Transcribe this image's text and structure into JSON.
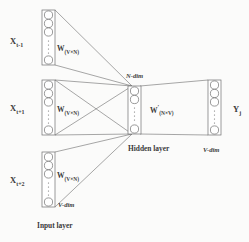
{
  "diagram": {
    "type": "neural-network",
    "stroke_color": "#6f6f6f",
    "text_color": "#3b3b3b",
    "background": "#fbfbfa"
  },
  "input_layer": {
    "caption": "Input layer",
    "dim_label": "V-dim",
    "blocks": [
      {
        "id": "input-block-top",
        "variable": "X",
        "subscript": "t-1",
        "weight": "W",
        "weight_subscript": "(V×N)",
        "neurons": 4,
        "has_vertical_dots": true,
        "x": 42,
        "y": 10,
        "w": 13,
        "h": 55
      },
      {
        "id": "input-block-middle",
        "variable": "X",
        "subscript": "t+1",
        "weight": "W",
        "weight_subscript": "(V×N)",
        "neurons": 4,
        "has_vertical_dots": true,
        "x": 42,
        "y": 80,
        "w": 13,
        "h": 55
      },
      {
        "id": "input-block-bottom",
        "variable": "X",
        "subscript": "t+2",
        "weight": "W",
        "weight_subscript": "(V×N)",
        "neurons": 4,
        "has_vertical_dots": true,
        "x": 42,
        "y": 152,
        "w": 13,
        "h": 55
      }
    ]
  },
  "hidden_layer": {
    "caption": "Hidden layer",
    "dim_label": "N-dim",
    "weight": "W",
    "weight_prime": "′",
    "weight_subscript": "(N×V)",
    "neurons": 4,
    "has_vertical_dots": true,
    "x": 128,
    "y": 86,
    "w": 13,
    "h": 48
  },
  "output_layer": {
    "variable": "Y",
    "subscript": "j",
    "dim_label": "V-dim",
    "neurons": 4,
    "has_vertical_dots": true,
    "x": 208,
    "y": 80,
    "w": 13,
    "h": 55
  },
  "labels": {
    "x_top": "X",
    "x_top_sub": "t-1",
    "x_mid": "X",
    "x_mid_sub": "t+1",
    "x_bot": "X",
    "x_bot_sub": "t+2",
    "w_top": "W",
    "w_top_sub": "(V×N)",
    "w_mid": "W",
    "w_mid_sub": "(V×N)",
    "w_bot": "W",
    "w_bot_sub": "(V×N)",
    "w_out": "W",
    "w_out_prime": "′",
    "w_out_sub": "(N×V)",
    "n_dim": "N-dim",
    "v_dim_bottom": "V-dim",
    "v_dim_right": "V-dim",
    "hidden_caption": "Hidden layer",
    "input_caption": "Input layer",
    "y_out": "Y",
    "y_out_sub": "j"
  }
}
